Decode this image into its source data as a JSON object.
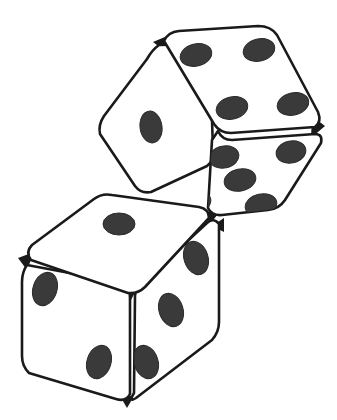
{
  "scene": {
    "title": "Two dice illustration",
    "background_color": "#ffffff",
    "width": 337,
    "height": 420,
    "style": "line-art black-and-white isometric drawing"
  },
  "palette": {
    "die_face_fill": "#ffffff",
    "outline_color": "#1a1a1a",
    "pip_color": "#3a3a3a",
    "pip_edge_color": "#2b2b2b",
    "vertex_junction_color": "#1a1a1a",
    "background": "#ffffff"
  },
  "dice": [
    {
      "id": "upper-die",
      "label": "Upper die",
      "z_order": 1,
      "rotation_deg": -15,
      "occluded_by": "lower-die",
      "total_visible_pips": 10,
      "faces": [
        {
          "id": "upper-die-top-face",
          "name": "top",
          "value": 4,
          "pips_visible": 4,
          "pip_layout": "four-corners",
          "fill": "#ffffff"
        },
        {
          "id": "upper-die-left-face",
          "name": "left",
          "value": 1,
          "pips_visible": 1,
          "pip_layout": "center",
          "fill": "#ffffff"
        },
        {
          "id": "upper-die-right-face",
          "name": "right",
          "value": 5,
          "pips_visible": 5,
          "pip_layout": "quincunx",
          "fill": "#ffffff",
          "note": "bottom-left pip partially hidden behind lower die"
        }
      ]
    },
    {
      "id": "lower-die",
      "label": "Lower die",
      "z_order": 2,
      "rotation_deg": 0,
      "occluded_by": null,
      "total_visible_pips": 6,
      "faces": [
        {
          "id": "lower-die-top-face",
          "name": "top",
          "value": 1,
          "pips_visible": 1,
          "pip_layout": "center",
          "fill": "#ffffff"
        },
        {
          "id": "lower-die-left-face",
          "name": "left",
          "value": 2,
          "pips_visible": 2,
          "pip_layout": "diagonal-down",
          "fill": "#ffffff"
        },
        {
          "id": "lower-die-right-face",
          "name": "right",
          "value": 3,
          "pips_visible": 3,
          "pip_layout": "diagonal-up",
          "fill": "#ffffff"
        }
      ]
    }
  ],
  "geometry": {
    "upper_die": {
      "top_face_path": "M 164 41 Q 168 32 179 31 L 258 26 Q 271 26 277 35 L 318 112 Q 322 122 315 127 L 231 133 Q 220 133 214 124 Z",
      "left_face_path": "M 159 45 Q 152 50 147 59 L 104 116 Q 98 125 100 134 L 135 186 Q 141 194 151 192 L 207 166 Q 214 161 213 151 L 210 56 Q 209 47 202 44 Z",
      "right_face_path": "M 218 131 Q 222 140 232 140 L 315 134 Q 323 134 321 143 L 285 200 Q 279 209 268 210 L 222 215 Q 212 216 208 208 L 212 140 Z",
      "top_vertex": [
        161,
        40
      ],
      "right_vertex": [
        318,
        128
      ],
      "bottom_vertex": [
        210,
        218
      ]
    },
    "lower_die": {
      "top_face_path": "M 31 260 Q 25 252 32 245 L 94 199 Q 102 193 112 195 L 199 207 Q 209 209 209 218 L 145 287 Q 138 294 128 293 Z",
      "left_face_path": "M 27 265 Q 22 272 22 282 L 22 356 Q 22 366 29 373 L 116 399 Q 126 402 130 394 L 130 298 Q 130 288 123 283 Z",
      "right_face_path": "M 135 296 Q 135 288 142 283 L 207 223 Q 214 217 219 224 L 219 322 Q 219 332 212 340 L 136 398 Q 128 403 134 393 Z",
      "top_vertex": [
        100,
        193
      ],
      "left_vertex": [
        22,
        262
      ],
      "right_vertex": [
        219,
        222
      ],
      "bottom_vertex": [
        127,
        400
      ],
      "center_vertex": [
        131,
        293
      ]
    }
  },
  "pips": {
    "upper_top": [
      {
        "cx": 196,
        "cy": 55,
        "rx": 16,
        "ry": 11,
        "rot": -14
      },
      {
        "cx": 259,
        "cy": 50,
        "rx": 16,
        "ry": 11,
        "rot": -14
      },
      {
        "cx": 232,
        "cy": 108,
        "rx": 16,
        "ry": 11,
        "rot": -14
      },
      {
        "cx": 293,
        "cy": 104,
        "rx": 16,
        "ry": 11,
        "rot": -14
      }
    ],
    "upper_left": [
      {
        "cx": 151,
        "cy": 127,
        "rx": 11,
        "ry": 16,
        "rot": -8
      }
    ],
    "upper_right": [
      {
        "cx": 224,
        "cy": 157,
        "rx": 15,
        "ry": 11,
        "rot": -12
      },
      {
        "cx": 291,
        "cy": 152,
        "rx": 15,
        "ry": 11,
        "rot": -12
      },
      {
        "cx": 240,
        "cy": 180,
        "rx": 16,
        "ry": 11,
        "rot": -12
      },
      {
        "cx": 261,
        "cy": 205,
        "rx": 16,
        "ry": 11,
        "rot": -12
      },
      {
        "cx": 196,
        "cy": 202,
        "rx": 15,
        "ry": 11,
        "rot": -12
      }
    ],
    "lower_top": [
      {
        "cx": 119,
        "cy": 224,
        "rx": 16,
        "ry": 11,
        "rot": 0
      }
    ],
    "lower_left": [
      {
        "cx": 45,
        "cy": 289,
        "rx": 12,
        "ry": 17,
        "rot": 18
      },
      {
        "cx": 99,
        "cy": 362,
        "rx": 12,
        "ry": 17,
        "rot": 18
      }
    ],
    "lower_right": [
      {
        "cx": 196,
        "cy": 258,
        "rx": 12,
        "ry": 17,
        "rot": -18
      },
      {
        "cx": 171,
        "cy": 310,
        "rx": 12,
        "ry": 17,
        "rot": -18
      },
      {
        "cx": 146,
        "cy": 362,
        "rx": 12,
        "ry": 17,
        "rot": -18
      }
    ]
  }
}
